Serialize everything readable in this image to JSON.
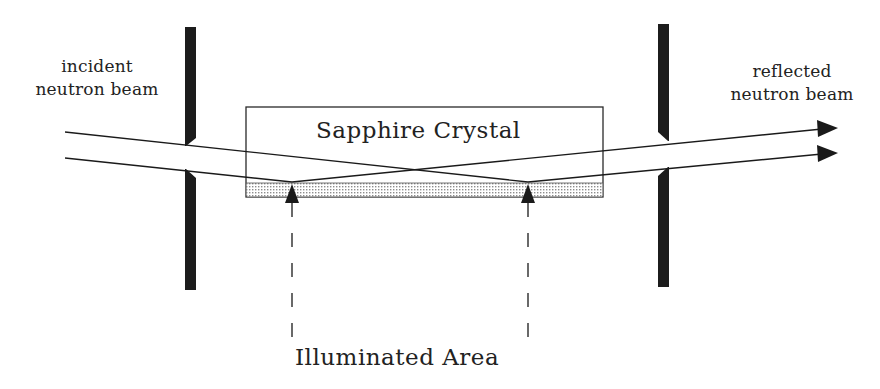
{
  "diagram": {
    "labels": {
      "incident_line1": "incident",
      "incident_line2": "neutron beam",
      "reflected_line1": "reflected",
      "reflected_line2": "neutron beam",
      "crystal": "Sapphire Crystal",
      "illuminated": "Illuminated Area"
    },
    "colors": {
      "ink": "#1a1a1a",
      "slit": "#1c1c1c",
      "stipple": "#9a9a9a",
      "background": "#ffffff"
    },
    "elements": {
      "entrance_slit": "left-slit",
      "exit_slit": "right-slit",
      "sample": "sapphire-crystal",
      "beams": [
        "incident-beam-1",
        "incident-beam-2",
        "reflected-beam-1",
        "reflected-beam-2"
      ],
      "markers": [
        "illuminated-area-left-marker",
        "illuminated-area-right-marker"
      ]
    }
  }
}
